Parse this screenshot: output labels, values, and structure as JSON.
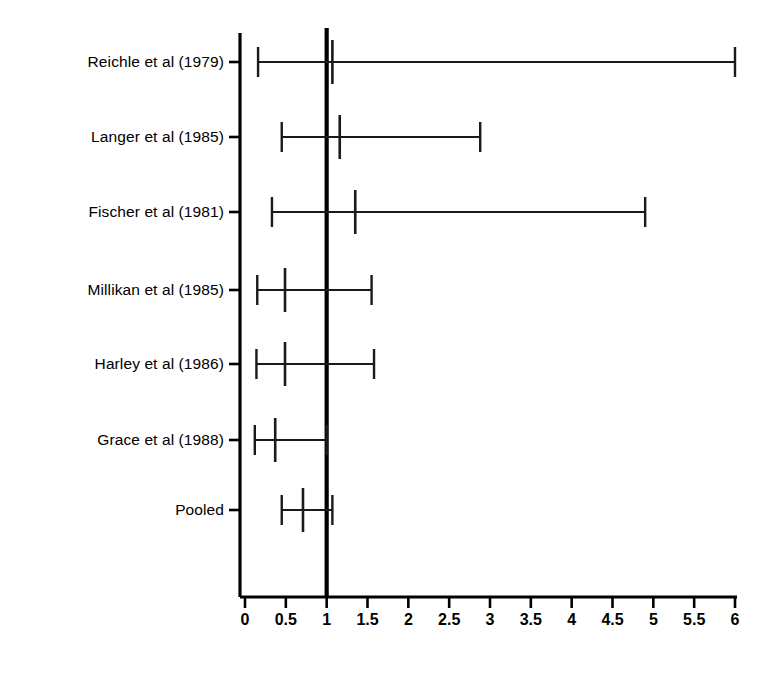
{
  "chart_data": {
    "type": "forest",
    "title": "",
    "xlabel": "",
    "ylabel": "",
    "xlim": [
      0,
      6
    ],
    "xticks": [
      0,
      0.5,
      1,
      1.5,
      2,
      2.5,
      3,
      3.5,
      4,
      4.5,
      5,
      5.5,
      6
    ],
    "xtick_labels": [
      "0",
      "0.5",
      "1",
      "1.5",
      "2",
      "2.5",
      "3",
      "3.5",
      "4",
      "4.5",
      "5",
      "5.5",
      "6"
    ],
    "null_line": 1,
    "grid": false,
    "legend": null,
    "categories": [
      "Reichle et al (1979)",
      "Langer et al (1985)",
      "Fischer et al (1981)",
      "Millikan et al (1985)",
      "Harley et al (1986)",
      "Grace et al (1988)",
      "Pooled"
    ],
    "rows": [
      {
        "label": "Reichle et al (1979)",
        "estimate": 1.07,
        "ci_low": 0.16,
        "ci_high": 6.0,
        "truncated_high": true
      },
      {
        "label": "Langer et al (1985)",
        "estimate": 1.16,
        "ci_low": 0.45,
        "ci_high": 2.88,
        "truncated_high": false
      },
      {
        "label": "Fischer et al (1981)",
        "estimate": 1.35,
        "ci_low": 0.33,
        "ci_high": 4.9,
        "truncated_high": false
      },
      {
        "label": "Millikan et al (1985)",
        "estimate": 0.49,
        "ci_low": 0.15,
        "ci_high": 1.55,
        "truncated_high": false
      },
      {
        "label": "Harley et al (1986)",
        "estimate": 0.49,
        "ci_low": 0.14,
        "ci_high": 1.58,
        "truncated_high": false
      },
      {
        "label": "Grace et al (1988)",
        "estimate": 0.37,
        "ci_low": 0.12,
        "ci_high": 1.0,
        "truncated_high": false
      },
      {
        "label": "Pooled",
        "estimate": 0.71,
        "ci_low": 0.45,
        "ci_high": 1.07,
        "truncated_high": false
      }
    ]
  },
  "colors": {
    "axis": "#000000",
    "line": "#1a1a1a",
    "null_line": "#000000",
    "background": "#ffffff"
  }
}
